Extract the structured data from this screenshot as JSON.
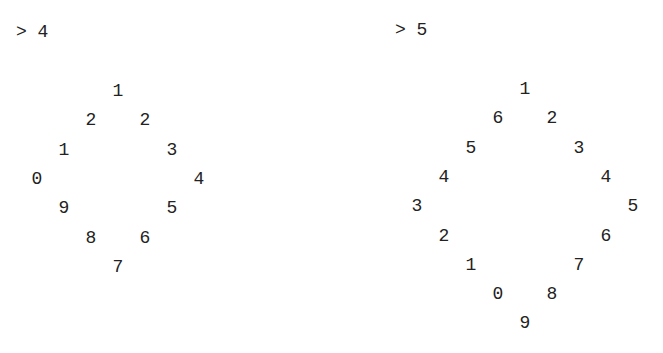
{
  "panels": [
    {
      "prompt": "> 4",
      "input": 4,
      "grid": {
        "rows": 7,
        "cols": 7,
        "cells": [
          {
            "r": 0,
            "c": 3,
            "v": "1"
          },
          {
            "r": 1,
            "c": 2,
            "v": "2"
          },
          {
            "r": 1,
            "c": 4,
            "v": "2"
          },
          {
            "r": 2,
            "c": 1,
            "v": "1"
          },
          {
            "r": 2,
            "c": 5,
            "v": "3"
          },
          {
            "r": 3,
            "c": 0,
            "v": "0"
          },
          {
            "r": 3,
            "c": 6,
            "v": "4"
          },
          {
            "r": 4,
            "c": 1,
            "v": "9"
          },
          {
            "r": 4,
            "c": 5,
            "v": "5"
          },
          {
            "r": 5,
            "c": 2,
            "v": "8"
          },
          {
            "r": 5,
            "c": 4,
            "v": "6"
          },
          {
            "r": 6,
            "c": 3,
            "v": "7"
          }
        ]
      }
    },
    {
      "prompt": "> 5",
      "input": 5,
      "grid": {
        "rows": 9,
        "cols": 9,
        "cells": [
          {
            "r": 0,
            "c": 4,
            "v": "1"
          },
          {
            "r": 1,
            "c": 3,
            "v": "6"
          },
          {
            "r": 1,
            "c": 5,
            "v": "2"
          },
          {
            "r": 2,
            "c": 2,
            "v": "5"
          },
          {
            "r": 2,
            "c": 6,
            "v": "3"
          },
          {
            "r": 3,
            "c": 1,
            "v": "4"
          },
          {
            "r": 3,
            "c": 7,
            "v": "4"
          },
          {
            "r": 4,
            "c": 0,
            "v": "3"
          },
          {
            "r": 4,
            "c": 8,
            "v": "5"
          },
          {
            "r": 5,
            "c": 1,
            "v": "2"
          },
          {
            "r": 5,
            "c": 7,
            "v": "6"
          },
          {
            "r": 6,
            "c": 2,
            "v": "1"
          },
          {
            "r": 6,
            "c": 6,
            "v": "7"
          },
          {
            "r": 7,
            "c": 3,
            "v": "0"
          },
          {
            "r": 7,
            "c": 5,
            "v": "8"
          },
          {
            "r": 8,
            "c": 4,
            "v": "9"
          }
        ]
      }
    }
  ]
}
